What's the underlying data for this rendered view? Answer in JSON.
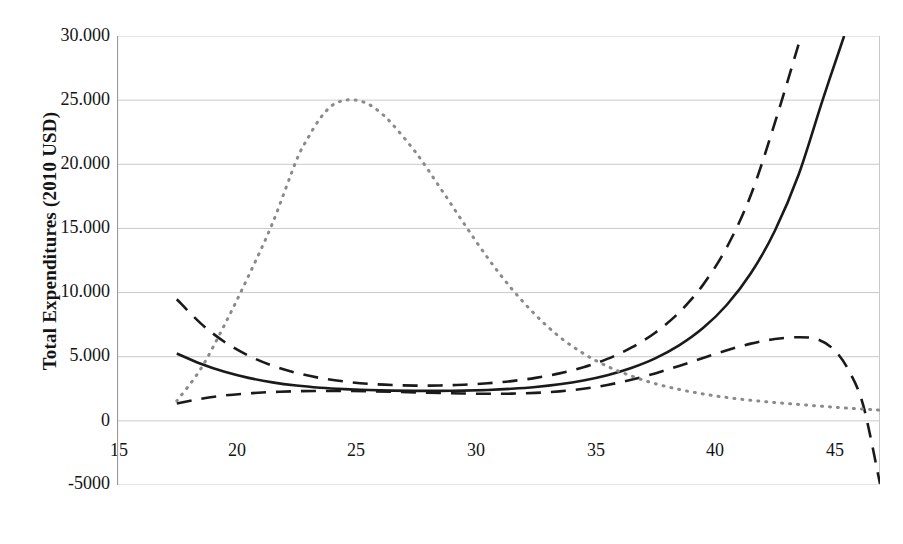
{
  "chart_data": {
    "type": "line",
    "title": "",
    "xlabel": "Body Mass Index",
    "ylabel": "Total Expenditures (2010 USD)",
    "xlim": [
      15,
      46.9
    ],
    "ylim": [
      -5000,
      30000
    ],
    "grid": true,
    "legend_position": "none",
    "xticks": [
      15,
      20,
      25,
      30,
      35,
      40,
      45
    ],
    "xtick_labels": [
      "15",
      "20",
      "25",
      "30",
      "35",
      "40",
      "45"
    ],
    "yticks": [
      30000,
      25000,
      20000,
      15000,
      10000,
      5000,
      0,
      -5000
    ],
    "ytick_labels": [
      "30.000",
      "25.000",
      "20.000",
      "15.000",
      "10.000",
      "5.000",
      "0",
      "-5000"
    ],
    "series": [
      {
        "name": "Predicted total expenditures",
        "style": "solid",
        "color": "#1a1a1a",
        "x": [
          17.5,
          18.5,
          19.5,
          20.5,
          21.5,
          22.5,
          23.5,
          24.5,
          25.5,
          26.5,
          27.5,
          28.5,
          29.5,
          30.5,
          31.5,
          32.5,
          33.5,
          34.5,
          35.5,
          36.5,
          37.5,
          38.5,
          39.5,
          40.5,
          41.5,
          42.5,
          43.5,
          44.5,
          45.4
        ],
        "values": [
          5250,
          4450,
          3820,
          3350,
          3000,
          2750,
          2580,
          2470,
          2400,
          2360,
          2340,
          2340,
          2360,
          2410,
          2500,
          2640,
          2850,
          3150,
          3560,
          4120,
          4870,
          5880,
          7230,
          9050,
          11500,
          14800,
          19200,
          25000,
          30000
        ]
      },
      {
        "name": "Upper 95% confidence interval",
        "style": "dashed",
        "color": "#1a1a1a",
        "x": [
          17.5,
          18.5,
          19.5,
          20.5,
          21.5,
          22.5,
          23.5,
          24.5,
          25.5,
          26.5,
          27.5,
          28.5,
          29.5,
          30.5,
          31.5,
          32.5,
          33.5,
          34.5,
          35.5,
          36.5,
          37.5,
          38.5,
          39.5,
          40.5,
          41.5,
          42.5,
          43.6
        ],
        "values": [
          9480,
          7600,
          6150,
          5080,
          4300,
          3740,
          3340,
          3070,
          2890,
          2790,
          2750,
          2760,
          2820,
          2930,
          3100,
          3350,
          3700,
          4180,
          4830,
          5700,
          6870,
          8450,
          10600,
          13550,
          17600,
          23200,
          30000
        ]
      },
      {
        "name": "Lower 95% confidence interval",
        "style": "dashed",
        "color": "#1a1a1a",
        "x": [
          17.5,
          18.5,
          19.5,
          20.5,
          21.5,
          22.5,
          23.5,
          24.5,
          25.5,
          26.5,
          27.5,
          28.5,
          29.5,
          30.5,
          31.5,
          32.5,
          33.5,
          34.5,
          35.5,
          36.5,
          37.5,
          38.5,
          39.5,
          40.5,
          41.5,
          42.5,
          43.5,
          44.3,
          45.0,
          45.6,
          46.2,
          46.9
        ],
        "values": [
          1350,
          1720,
          1980,
          2140,
          2250,
          2310,
          2330,
          2330,
          2310,
          2270,
          2220,
          2170,
          2130,
          2110,
          2120,
          2180,
          2300,
          2500,
          2800,
          3200,
          3700,
          4280,
          4900,
          5500,
          6020,
          6380,
          6520,
          6350,
          5500,
          3900,
          1200,
          -4900
        ]
      },
      {
        "name": "BMI distribution",
        "style": "dotted",
        "color": "#8a8a8a",
        "x": [
          17.5,
          18.5,
          19.5,
          20.5,
          21.5,
          22.5,
          23.0,
          23.5,
          24.0,
          24.5,
          25.0,
          25.5,
          26.0,
          26.5,
          27.5,
          28.5,
          29.5,
          30.5,
          31.5,
          32.5,
          33.5,
          34.5,
          35.5,
          36.5,
          37.5,
          38.5,
          39.5,
          40.5,
          41.5,
          42.5,
          43.5,
          44.5,
          45.5,
          46.9
        ],
        "values": [
          1550,
          4050,
          7500,
          11300,
          15400,
          20300,
          22100,
          23600,
          24600,
          24980,
          25000,
          24700,
          24050,
          23150,
          20900,
          18200,
          15400,
          12700,
          10300,
          8250,
          6550,
          5250,
          4250,
          3500,
          2900,
          2450,
          2100,
          1820,
          1600,
          1430,
          1280,
          1130,
          1000,
          830
        ]
      }
    ]
  },
  "axes": {
    "colors": {
      "gridline": "#c9c9c9",
      "axis": "#9a9a9a",
      "text": "#141414",
      "curve": "#1a1a1a",
      "distribution": "#8a8a8a"
    }
  },
  "caption": {
    "text": ""
  }
}
